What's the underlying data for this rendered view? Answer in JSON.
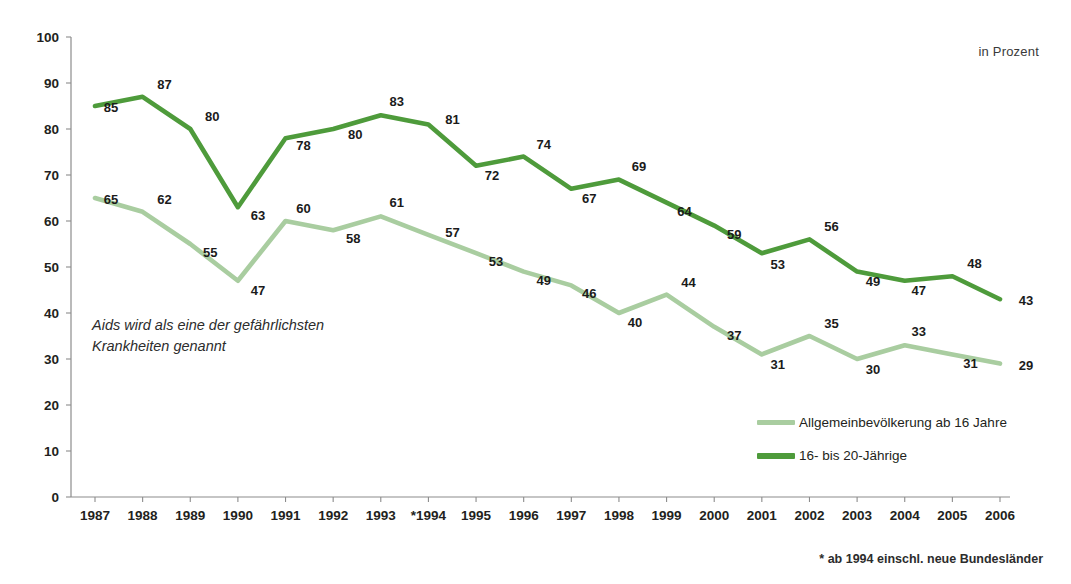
{
  "unit_label": "in Prozent",
  "annotation": {
    "line1": "Aids wird als eine der gefährlichsten",
    "line2": "Krankheiten genannt"
  },
  "footnote": "* ab 1994 einschl. neue Bundesländer",
  "legend": {
    "items": [
      {
        "label": "Allgemeinbevölkerung ab 16 Jahre",
        "color": "#a9cda0"
      },
      {
        "label": "16- bis 20-Jährige",
        "color": "#4e9b3b"
      }
    ]
  },
  "colors": {
    "general_population": "#a9cda0",
    "youth": "#4e9b3b",
    "axis": "#8c8c8c",
    "text": "#231f20",
    "background": "#ffffff"
  },
  "chart_data": {
    "type": "line",
    "title": "",
    "subtitle": "",
    "xlabel": "",
    "ylabel": "",
    "unit": "in Prozent",
    "grid": false,
    "legend_position": "bottom-right",
    "ylim": [
      0,
      100
    ],
    "ytick_step": 10,
    "yticks": [
      0,
      10,
      20,
      30,
      40,
      50,
      60,
      70,
      80,
      90,
      100
    ],
    "categories": [
      "1987",
      "1988",
      "1989",
      "1990",
      "1991",
      "1992",
      "1993",
      "*1994",
      "1995",
      "1996",
      "1997",
      "1998",
      "1999",
      "2000",
      "2001",
      "2002",
      "2003",
      "2004",
      "2005",
      "2006"
    ],
    "series": [
      {
        "name": "16- bis 20-Jährige",
        "color": "#4e9b3b",
        "values": [
          85,
          87,
          80,
          63,
          78,
          80,
          83,
          81,
          72,
          74,
          67,
          69,
          64,
          59,
          53,
          56,
          49,
          47,
          48,
          43
        ]
      },
      {
        "name": "Allgemeinbevölkerung ab 16 Jahre",
        "color": "#a9cda0",
        "values": [
          65,
          62,
          55,
          47,
          60,
          58,
          61,
          57,
          53,
          49,
          46,
          40,
          44,
          37,
          31,
          35,
          30,
          33,
          31,
          29
        ]
      }
    ],
    "annotations": [
      "Aids wird als eine der gefährlichsten Krankheiten genannt",
      "* ab 1994 einschl. neue Bundesländer"
    ]
  }
}
